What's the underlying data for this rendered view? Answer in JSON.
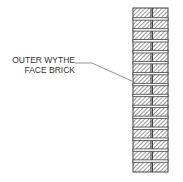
{
  "diagram": {
    "callout": {
      "line1": "OUTER WYTHE",
      "line2": "FACE BRICK"
    },
    "colors": {
      "line": "#444444",
      "hatch": "#555555",
      "leader": "#777777"
    },
    "wall": {
      "courses": 15
    }
  }
}
